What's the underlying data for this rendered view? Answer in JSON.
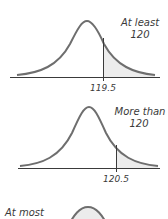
{
  "colors": {
    "curve": "#6e6e6e",
    "shade": "#ececec",
    "axis": "#3a3a3a",
    "text": "#3a3a3a"
  },
  "panels": [
    {
      "label_line1": "At least",
      "label_line2": "120",
      "cutoff_label": "119.5",
      "shaded_side": "right"
    },
    {
      "label_line1": "More than",
      "label_line2": "120",
      "cutoff_label": "120.5",
      "shaded_side": "right"
    },
    {
      "label_line1": "At most",
      "label_line2": "",
      "cutoff_label": "",
      "shaded_side": "left"
    }
  ]
}
